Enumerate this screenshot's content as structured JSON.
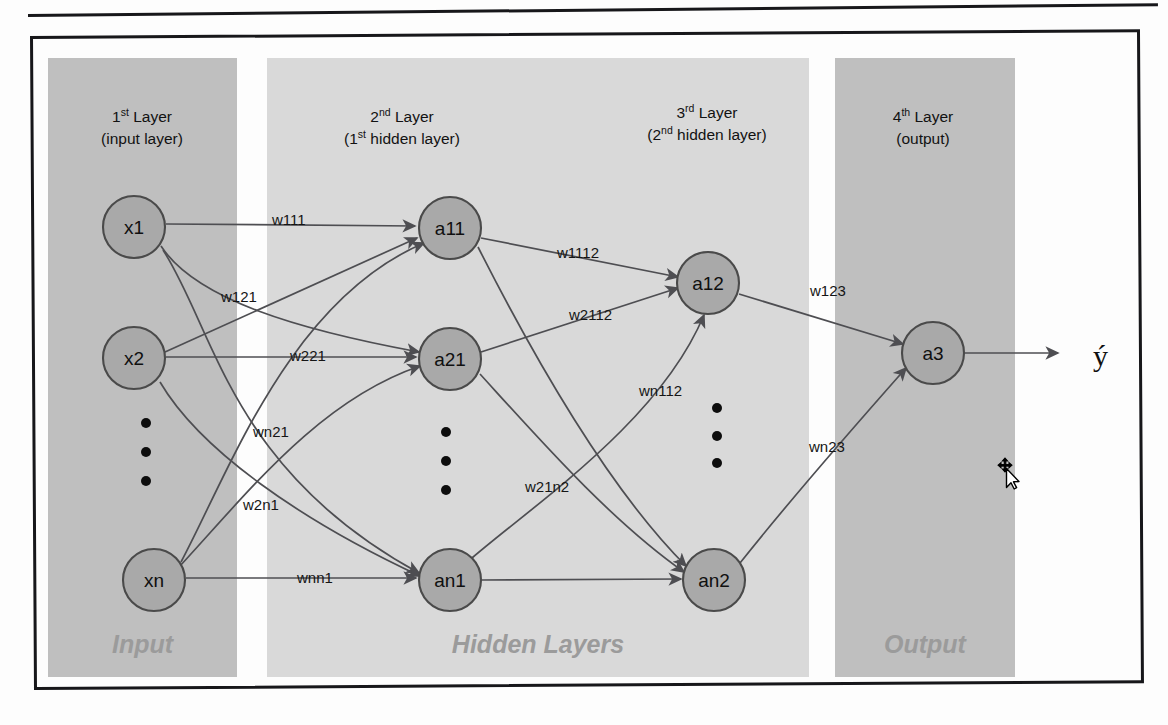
{
  "figure": {
    "type": "neural-network-architecture-diagram",
    "output_symbol": "ý"
  },
  "bands": [
    {
      "id": "input",
      "label": "Input",
      "color": "#bfbfbf",
      "x": 48,
      "y": 58,
      "w": 189,
      "h": 619
    },
    {
      "id": "hidden",
      "label": "Hidden Layers",
      "color": "#d9d9d9",
      "x": 267,
      "y": 58,
      "w": 542,
      "h": 619
    },
    {
      "id": "output",
      "label": "Output",
      "color": "#bfbfbf",
      "x": 835,
      "y": 58,
      "w": 180,
      "h": 619
    }
  ],
  "layer_titles": [
    {
      "id": "layer-1",
      "ordinal": "1",
      "sup": "st",
      "rest": " Layer",
      "sub": "(input layer)",
      "x": 142,
      "y": 122
    },
    {
      "id": "layer-2",
      "ordinal": "2",
      "sup": "nd",
      "rest": "  Layer",
      "sub": "(1st hidden layer)",
      "x": 402,
      "y": 122,
      "sub_ordinal": "1",
      "sub_sup": "st",
      "sub_pre": "(",
      "sub_post": " hidden layer)"
    },
    {
      "id": "layer-3",
      "ordinal": "3",
      "sup": "rd",
      "rest": " Layer",
      "sub": "(2nd hidden layer)",
      "x": 707,
      "y": 118,
      "sub_ordinal": "2",
      "sub_sup": "nd",
      "sub_pre": "(",
      "sub_post": " hidden layer)"
    },
    {
      "id": "layer-4",
      "ordinal": "4",
      "sup": "th",
      "rest": " Layer",
      "sub": "(output)",
      "x": 923,
      "y": 122
    }
  ],
  "nodes": [
    {
      "id": "x1",
      "label": "x1",
      "cx": 134,
      "cy": 227,
      "r": 31
    },
    {
      "id": "x2",
      "label": "x2",
      "cx": 134,
      "cy": 358,
      "r": 31
    },
    {
      "id": "xn",
      "label": "xn",
      "cx": 154,
      "cy": 580,
      "r": 31
    },
    {
      "id": "a11",
      "label": "a11",
      "cx": 450,
      "cy": 228,
      "r": 31
    },
    {
      "id": "a21",
      "label": "a21",
      "cx": 450,
      "cy": 359,
      "r": 31
    },
    {
      "id": "an1",
      "label": "an1",
      "cx": 450,
      "cy": 580,
      "r": 31
    },
    {
      "id": "a12",
      "label": "a12",
      "cx": 708,
      "cy": 283,
      "r": 31
    },
    {
      "id": "an2",
      "label": "an2",
      "cx": 714,
      "cy": 580,
      "r": 31
    },
    {
      "id": "a3",
      "label": "a3",
      "cx": 933,
      "cy": 353,
      "r": 31
    }
  ],
  "dot_columns": [
    {
      "id": "input-ellipsis",
      "cx": 146,
      "ys": [
        423,
        452,
        481
      ],
      "r": 5
    },
    {
      "id": "hidden1-ellipsis",
      "cx": 446,
      "ys": [
        432,
        461,
        490
      ],
      "r": 5
    },
    {
      "id": "hidden2-ellipsis",
      "cx": 717,
      "ys": [
        408,
        436,
        463
      ],
      "r": 5
    }
  ],
  "weights": [
    {
      "id": "w111",
      "label": "w111",
      "x": 272,
      "y": 225
    },
    {
      "id": "w121",
      "label": "w121",
      "x": 221,
      "y": 302
    },
    {
      "id": "w221",
      "label": "w221",
      "x": 290,
      "y": 361
    },
    {
      "id": "wn21",
      "label": "wn21",
      "x": 253,
      "y": 437
    },
    {
      "id": "w2n1",
      "label": "w2n1",
      "x": 243,
      "y": 510
    },
    {
      "id": "wnn1",
      "label": "wnn1",
      "x": 297,
      "y": 583
    },
    {
      "id": "w1112",
      "label": "w1112",
      "x": 557,
      "y": 258
    },
    {
      "id": "w2112",
      "label": "w2112",
      "x": 569,
      "y": 320
    },
    {
      "id": "wn112",
      "label": "wn112",
      "x": 639,
      "y": 396
    },
    {
      "id": "w21n2",
      "label": "w21n2",
      "x": 525,
      "y": 492
    },
    {
      "id": "w123",
      "label": "w123",
      "x": 810,
      "y": 296
    },
    {
      "id": "wn23",
      "label": "wn23",
      "x": 809,
      "y": 452
    }
  ],
  "edges": [
    {
      "id": "x1-a11",
      "d": "M 166,224 L 415,226",
      "arrow": true
    },
    {
      "id": "x1-a21",
      "d": "M 161,246 C 196,300 300,330 419,352",
      "arrow": true
    },
    {
      "id": "x1-an1",
      "d": "M 163,250 C 215,330 230,470 419,573",
      "arrow": true
    },
    {
      "id": "x2-a11",
      "d": "M 165,352 L 417,238",
      "arrow": true
    },
    {
      "id": "x2-a21",
      "d": "M 166,357 L 416,357",
      "arrow": true
    },
    {
      "id": "x2-an1",
      "d": "M 160,382 C 200,450 300,520 420,576",
      "arrow": true
    },
    {
      "id": "xn-a11",
      "d": "M 181,562 C 230,470 290,300 424,243",
      "arrow": true
    },
    {
      "id": "xn-a21",
      "d": "M 180,566 C 250,490 320,400 420,366",
      "arrow": true
    },
    {
      "id": "xn-an1",
      "d": "M 186,578 L 416,578",
      "arrow": true
    },
    {
      "id": "a11-a12",
      "d": "M 481,238 L 678,277",
      "arrow": true
    },
    {
      "id": "a21-a12",
      "d": "M 481,352 L 678,288",
      "arrow": true
    },
    {
      "id": "a11-an2",
      "d": "M 478,247 C 520,330 600,480 686,566",
      "arrow": true
    },
    {
      "id": "a21-an2",
      "d": "M 480,374 C 540,440 610,520 684,572",
      "arrow": true
    },
    {
      "id": "an1-a12",
      "d": "M 472,558 C 540,500 660,420 704,315",
      "arrow": true
    },
    {
      "id": "an1-an2",
      "d": "M 481,580 L 681,579",
      "arrow": true
    },
    {
      "id": "a12-a3",
      "d": "M 739,294 L 903,344",
      "arrow": true
    },
    {
      "id": "an2-a3",
      "d": "M 740,563 C 790,500 860,420 906,368",
      "arrow": true
    },
    {
      "id": "a3-out",
      "d": "M 965,353 L 1058,353",
      "arrow": true
    }
  ],
  "cursor": {
    "id": "move-cursor",
    "x": 996,
    "y": 456
  }
}
